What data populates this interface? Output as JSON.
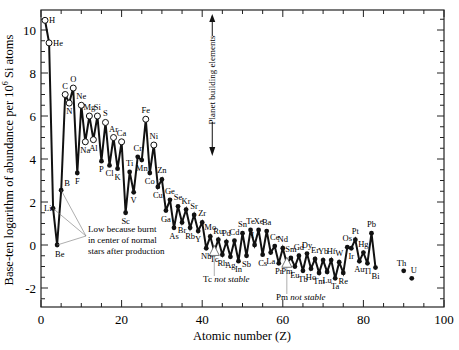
{
  "chart_data": {
    "type": "line",
    "title": "",
    "xlabel": "Atomic number (Z)",
    "ylabel": "Base-ten logarithm of abundance per 10^6 Si atoms",
    "ylabel_parts": {
      "pre": "Base-ten logarithm of abundance per 10",
      "sup": "6",
      "post": " Si atoms"
    },
    "xlim": [
      0,
      100
    ],
    "ylim": [
      -2.9,
      10.9
    ],
    "xticks": [
      0,
      20,
      40,
      60,
      80,
      100
    ],
    "yticks": [
      -2,
      0,
      2,
      4,
      6,
      8,
      10
    ],
    "grid": false,
    "legend": "none",
    "points": [
      {
        "z": 1,
        "el": "H",
        "y": 10.45,
        "open": true
      },
      {
        "z": 2,
        "el": "He",
        "y": 9.4,
        "open": true
      },
      {
        "z": 3,
        "el": "Li",
        "y": 1.7,
        "open": false
      },
      {
        "z": 4,
        "el": "Be",
        "y": 0.0,
        "open": false
      },
      {
        "z": 5,
        "el": "B",
        "y": 2.55,
        "open": false
      },
      {
        "z": 6,
        "el": "C",
        "y": 7.0,
        "open": true
      },
      {
        "z": 7,
        "el": "N",
        "y": 6.6,
        "open": true
      },
      {
        "z": 8,
        "el": "O",
        "y": 7.3,
        "open": true
      },
      {
        "z": 9,
        "el": "F",
        "y": 3.35,
        "open": false
      },
      {
        "z": 10,
        "el": "Ne",
        "y": 6.5,
        "open": true
      },
      {
        "z": 11,
        "el": "Na",
        "y": 4.8,
        "open": true
      },
      {
        "z": 12,
        "el": "Mg",
        "y": 6.0,
        "open": true
      },
      {
        "z": 13,
        "el": "Al",
        "y": 4.9,
        "open": true
      },
      {
        "z": 14,
        "el": "Si",
        "y": 6.0,
        "open": true
      },
      {
        "z": 15,
        "el": "P",
        "y": 3.9,
        "open": false
      },
      {
        "z": 16,
        "el": "S",
        "y": 5.7,
        "open": true
      },
      {
        "z": 17,
        "el": "Cl",
        "y": 3.7,
        "open": false
      },
      {
        "z": 18,
        "el": "Ar",
        "y": 5.0,
        "open": true
      },
      {
        "z": 19,
        "el": "K",
        "y": 3.55,
        "open": false
      },
      {
        "z": 20,
        "el": "Ca",
        "y": 4.8,
        "open": true
      },
      {
        "z": 21,
        "el": "Sc",
        "y": 1.5,
        "open": false
      },
      {
        "z": 22,
        "el": "Ti",
        "y": 3.4,
        "open": false
      },
      {
        "z": 23,
        "el": "V",
        "y": 2.45,
        "open": false
      },
      {
        "z": 24,
        "el": "Cr",
        "y": 4.1,
        "open": false
      },
      {
        "z": 25,
        "el": "Mn",
        "y": 3.95,
        "open": false
      },
      {
        "z": 26,
        "el": "Fe",
        "y": 5.85,
        "open": true
      },
      {
        "z": 27,
        "el": "Co",
        "y": 3.35,
        "open": false
      },
      {
        "z": 28,
        "el": "Ni",
        "y": 4.65,
        "open": true
      },
      {
        "z": 29,
        "el": "Cu",
        "y": 2.7,
        "open": false
      },
      {
        "z": 30,
        "el": "Zn",
        "y": 3.05,
        "open": false
      },
      {
        "z": 31,
        "el": "Ga",
        "y": 1.6,
        "open": false
      },
      {
        "z": 32,
        "el": "Ge",
        "y": 2.1,
        "open": false
      },
      {
        "z": 33,
        "el": "As",
        "y": 0.8,
        "open": false
      },
      {
        "z": 34,
        "el": "Se",
        "y": 1.8,
        "open": false
      },
      {
        "z": 35,
        "el": "Br",
        "y": 1.05,
        "open": false
      },
      {
        "z": 36,
        "el": "Kr",
        "y": 1.65,
        "open": false
      },
      {
        "z": 37,
        "el": "Rb",
        "y": 0.8,
        "open": false
      },
      {
        "z": 38,
        "el": "Sr",
        "y": 1.4,
        "open": false
      },
      {
        "z": 39,
        "el": "Y",
        "y": 0.65,
        "open": false
      },
      {
        "z": 40,
        "el": "Zr",
        "y": 1.05,
        "open": false
      },
      {
        "z": 41,
        "el": "Nb",
        "y": -0.15,
        "open": false
      },
      {
        "z": 42,
        "el": "Mo",
        "y": 0.4,
        "open": false
      },
      {
        "z": 43,
        "el": "Tc",
        "y": -0.3,
        "open": true,
        "triangle": true
      },
      {
        "z": 44,
        "el": "Ru",
        "y": 0.25,
        "open": false
      },
      {
        "z": 45,
        "el": "Rh",
        "y": -0.45,
        "open": false
      },
      {
        "z": 46,
        "el": "Pd",
        "y": 0.15,
        "open": false
      },
      {
        "z": 47,
        "el": "Ag",
        "y": -0.55,
        "open": false
      },
      {
        "z": 48,
        "el": "Cd",
        "y": 0.2,
        "open": false
      },
      {
        "z": 49,
        "el": "In",
        "y": -0.75,
        "open": false
      },
      {
        "z": 50,
        "el": "Sn",
        "y": 0.55,
        "open": false
      },
      {
        "z": 51,
        "el": "Sb",
        "y": -0.5,
        "open": false
      },
      {
        "z": 52,
        "el": "Te",
        "y": 0.7,
        "open": false
      },
      {
        "z": 53,
        "el": "I",
        "y": 0.0,
        "open": false
      },
      {
        "z": 54,
        "el": "Xe",
        "y": 0.7,
        "open": false
      },
      {
        "z": 55,
        "el": "Cs",
        "y": -0.45,
        "open": false
      },
      {
        "z": 56,
        "el": "Ba",
        "y": 0.65,
        "open": false
      },
      {
        "z": 57,
        "el": "La",
        "y": -0.35,
        "open": false
      },
      {
        "z": 58,
        "el": "Ce",
        "y": -0.05,
        "open": false
      },
      {
        "z": 59,
        "el": "Pr",
        "y": -0.85,
        "open": false
      },
      {
        "z": 60,
        "el": "Nd",
        "y": -0.15,
        "open": false
      },
      {
        "z": 61,
        "el": "Pm",
        "y": -0.85,
        "open": true,
        "triangle": true
      },
      {
        "z": 62,
        "el": "Sm",
        "y": -0.6,
        "open": false
      },
      {
        "z": 63,
        "el": "Eu",
        "y": -1.0,
        "open": false
      },
      {
        "z": 64,
        "el": "Gd",
        "y": -0.5,
        "open": false
      },
      {
        "z": 65,
        "el": "Tb",
        "y": -1.2,
        "open": false
      },
      {
        "z": 66,
        "el": "Dy",
        "y": -0.4,
        "open": false
      },
      {
        "z": 67,
        "el": "Ho",
        "y": -1.1,
        "open": false
      },
      {
        "z": 68,
        "el": "Er",
        "y": -0.65,
        "open": false
      },
      {
        "z": 69,
        "el": "Tm",
        "y": -1.3,
        "open": false
      },
      {
        "z": 70,
        "el": "Yb",
        "y": -0.7,
        "open": false
      },
      {
        "z": 71,
        "el": "Lu",
        "y": -1.25,
        "open": false
      },
      {
        "z": 72,
        "el": "Hf",
        "y": -0.7,
        "open": false
      },
      {
        "z": 73,
        "el": "Ta",
        "y": -1.55,
        "open": false
      },
      {
        "z": 74,
        "el": "W",
        "y": -0.8,
        "open": false
      },
      {
        "z": 75,
        "el": "Re",
        "y": -1.3,
        "open": false
      },
      {
        "z": 76,
        "el": "Os",
        "y": -0.1,
        "open": false
      },
      {
        "z": 77,
        "el": "Ir",
        "y": -0.15,
        "open": false
      },
      {
        "z": 78,
        "el": "Pt",
        "y": 0.25,
        "open": false
      },
      {
        "z": 79,
        "el": "Au",
        "y": -0.75,
        "open": false
      },
      {
        "z": 80,
        "el": "Hg",
        "y": -0.35,
        "open": false
      },
      {
        "z": 81,
        "el": "Tl",
        "y": -0.85,
        "open": false
      },
      {
        "z": 82,
        "el": "Pb",
        "y": 0.55,
        "open": false
      },
      {
        "z": 83,
        "el": "Bi",
        "y": -1.05,
        "open": false
      },
      {
        "z": 90,
        "el": "Th",
        "y": -1.2,
        "open": false,
        "isolated": true
      },
      {
        "z": 92,
        "el": "U",
        "y": -1.55,
        "open": false,
        "isolated": true
      }
    ],
    "annotations": {
      "burnt_note": [
        "Low because burnt",
        "in center of normal",
        "stars after production"
      ],
      "planet_building": "Planet building elements",
      "tc_note": {
        "el": "Tc",
        "text": "not stable"
      },
      "pm_note": {
        "el": "Pm",
        "text": "not stable"
      }
    }
  }
}
